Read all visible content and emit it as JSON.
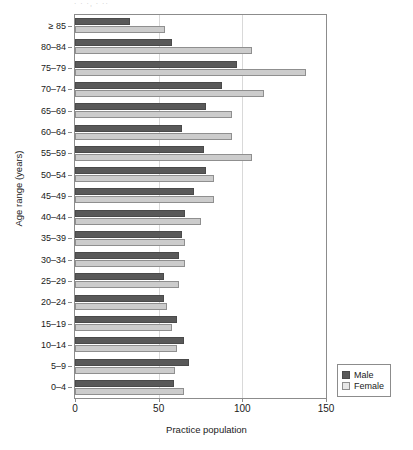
{
  "figure": {
    "cropped_title_fragment": "· ·  ·, ·   ··",
    "legend_position": "right-bottom"
  },
  "chart_data": {
    "type": "bar",
    "orientation": "horizontal",
    "title": "",
    "xlabel": "Practice population",
    "ylabel": "Age range (years)",
    "categories": [
      "≥ 85",
      "80–84",
      "75–79",
      "70–74",
      "65–69",
      "60–64",
      "55–59",
      "50–54",
      "45–49",
      "40–44",
      "35–39",
      "30–34",
      "25–29",
      "20–24",
      "15–19",
      "10–14",
      "5–9",
      "0–4"
    ],
    "series": [
      {
        "name": "Male",
        "color": "#595959",
        "values": [
          33,
          58,
          97,
          88,
          78,
          64,
          77,
          78,
          71,
          66,
          64,
          62,
          53,
          53,
          61,
          65,
          68,
          59
        ]
      },
      {
        "name": "Female",
        "color": "#cccccc",
        "values": [
          54,
          106,
          138,
          113,
          94,
          94,
          106,
          83,
          83,
          75,
          66,
          66,
          62,
          55,
          58,
          61,
          60,
          65
        ]
      }
    ],
    "xlim": [
      0,
      150
    ],
    "xticks": [
      0,
      50,
      100,
      150
    ],
    "xtick_labels": [
      "0",
      "50",
      "100",
      "150"
    ],
    "gridlines_x": [
      50,
      100
    ],
    "grid": true,
    "legend": {
      "entries": [
        "Male",
        "Female"
      ]
    }
  }
}
